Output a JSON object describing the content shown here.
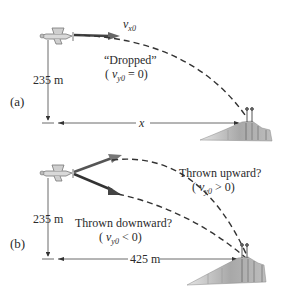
{
  "diagram": {
    "panel_a": {
      "label": "(a)",
      "velocity_label": "v",
      "velocity_sub": "x0",
      "dropped_label": "“Dropped”",
      "dropped_cond_open": "( ",
      "dropped_cond_v": "v",
      "dropped_cond_sub": "y0",
      "dropped_cond_rest": " = 0)",
      "height_label": "235 m",
      "distance_label": "x"
    },
    "panel_b": {
      "label": "(b)",
      "height_label": "235 m",
      "distance_label": "425 m",
      "upward_label": "Thrown upward?",
      "upward_cond_open": "( ",
      "upward_cond_v": "v",
      "upward_cond_sub": "y0",
      "upward_cond_rest": " > 0)",
      "downward_label": "Thrown downward?",
      "downward_cond_open": "( ",
      "downward_cond_v": "v",
      "downward_cond_sub": "y0",
      "downward_cond_rest": " < 0)"
    },
    "colors": {
      "line": "#333333",
      "arrow": "#555555",
      "cliff": "#9a9a9a",
      "text": "#2a2a2a"
    }
  }
}
